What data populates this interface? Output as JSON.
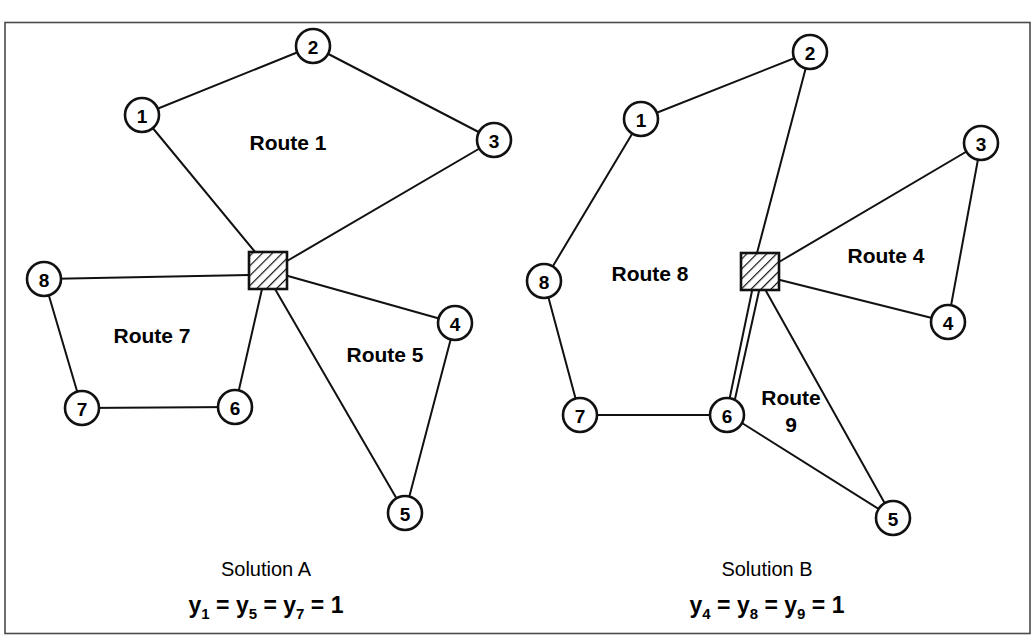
{
  "figure": {
    "title_cutoff": "FIGURE",
    "frame": {
      "x": 4,
      "y": 22,
      "width": 1026,
      "height": 612
    }
  },
  "panels": [
    {
      "id": "solution-a",
      "caption_title": "Solution A",
      "caption_equation": {
        "terms": [
          "y",
          "y",
          "y"
        ],
        "subscripts": [
          "1",
          "5",
          "7"
        ],
        "operator": "=",
        "value": "1",
        "full_text": "y1 = y5 = y7 = 1"
      },
      "depot": {
        "name": "depot",
        "x": 268,
        "y": 270,
        "size": 38
      },
      "nodes": [
        {
          "label": "1",
          "x": 142,
          "y": 115,
          "r": 17
        },
        {
          "label": "2",
          "x": 313,
          "y": 46,
          "r": 17
        },
        {
          "label": "3",
          "x": 494,
          "y": 140,
          "r": 17
        },
        {
          "label": "4",
          "x": 455,
          "y": 323,
          "r": 17
        },
        {
          "label": "5",
          "x": 405,
          "y": 513,
          "r": 17
        },
        {
          "label": "6",
          "x": 235,
          "y": 407,
          "r": 17
        },
        {
          "label": "7",
          "x": 82,
          "y": 408,
          "r": 17
        },
        {
          "label": "8",
          "x": 44,
          "y": 279,
          "r": 17
        }
      ],
      "route_labels": [
        {
          "text": "Route 1",
          "x": 288,
          "y": 150
        },
        {
          "text": "Route 7",
          "x": 152,
          "y": 343
        },
        {
          "text": "Route 5",
          "x": 385,
          "y": 362
        },
        {
          "text": "",
          "x": 0,
          "y": 0
        }
      ],
      "edges": [
        {
          "from": "1",
          "to": "2"
        },
        {
          "from": "2",
          "to": "3"
        },
        {
          "from": "3",
          "to": "depot"
        },
        {
          "from": "depot",
          "to": "1"
        },
        {
          "from": "8",
          "to": "depot"
        },
        {
          "from": "8",
          "to": "7"
        },
        {
          "from": "7",
          "to": "6"
        },
        {
          "from": "6",
          "to": "depot"
        },
        {
          "from": "depot",
          "to": "4"
        },
        {
          "from": "4",
          "to": "5"
        },
        {
          "from": "5",
          "to": "depot"
        }
      ]
    },
    {
      "id": "solution-b",
      "caption_title": "Solution B",
      "caption_equation": {
        "terms": [
          "y",
          "y",
          "y"
        ],
        "subscripts": [
          "4",
          "8",
          "9"
        ],
        "operator": "=",
        "value": "1",
        "full_text": "y4 = y8 = y9 = 1"
      },
      "depot": {
        "name": "depot",
        "x": 760,
        "y": 271,
        "size": 38
      },
      "nodes": [
        {
          "label": "1",
          "x": 641,
          "y": 119,
          "r": 17
        },
        {
          "label": "2",
          "x": 810,
          "y": 52,
          "r": 17
        },
        {
          "label": "3",
          "x": 981,
          "y": 143,
          "r": 17
        },
        {
          "label": "4",
          "x": 948,
          "y": 322,
          "r": 17
        },
        {
          "label": "5",
          "x": 893,
          "y": 518,
          "r": 17
        },
        {
          "label": "6",
          "x": 727,
          "y": 415,
          "r": 17
        },
        {
          "label": "7",
          "x": 580,
          "y": 415,
          "r": 17
        },
        {
          "label": "8",
          "x": 544,
          "y": 281,
          "r": 17
        }
      ],
      "route_labels": [
        {
          "text": "Route 8",
          "x": 650,
          "y": 281
        },
        {
          "text": "Route 4",
          "x": 886,
          "y": 263
        },
        {
          "text": "Route",
          "x": 791,
          "y": 405
        },
        {
          "text": "9",
          "x": 791,
          "y": 432
        }
      ],
      "edges": [
        {
          "from": "1",
          "to": "2"
        },
        {
          "from": "2",
          "to": "depot"
        },
        {
          "from": "1",
          "to": "8"
        },
        {
          "from": "8",
          "to": "7"
        },
        {
          "from": "7",
          "to": "6"
        },
        {
          "from": "6",
          "to": "depot"
        },
        {
          "from": "depot",
          "to": "3"
        },
        {
          "from": "3",
          "to": "4"
        },
        {
          "from": "4",
          "to": "depot"
        },
        {
          "from": "depot",
          "to": "5"
        },
        {
          "from": "5",
          "to": "6"
        }
      ]
    }
  ],
  "colors": {
    "ink": "#111111",
    "frame": "#4a4a4a",
    "background": "#ffffff"
  }
}
